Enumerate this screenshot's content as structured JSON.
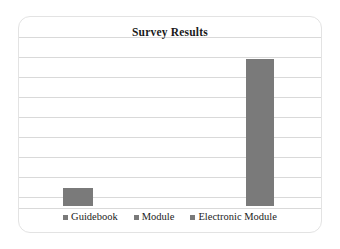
{
  "chart_data": {
    "type": "bar",
    "title": "Survey Results",
    "xlabel": "",
    "ylabel": "",
    "categories": [
      "Guidebook",
      "Module",
      "Electronic Module"
    ],
    "values": [
      1,
      0,
      8
    ],
    "ylim": [
      0,
      9
    ],
    "grid": true,
    "gridline_count": 9,
    "legend_position": "bottom",
    "series": [
      {
        "name": "Survey Results",
        "values": [
          1,
          0,
          8
        ],
        "color": "#7a7a7a"
      }
    ]
  },
  "card": {
    "title": "Survey Results"
  },
  "legend": {
    "items": [
      {
        "label": "Guidebook",
        "color": "#7a7a7a"
      },
      {
        "label": "Module",
        "color": "#7a7a7a"
      },
      {
        "label": "Electronic Module",
        "color": "#7a7a7a"
      }
    ]
  },
  "colors": {
    "bar": "#7a7a7a",
    "gridline": "#d9d9d9",
    "card_border": "#e3e3e3",
    "background": "#ffffff",
    "text": "#1a1a1a"
  }
}
